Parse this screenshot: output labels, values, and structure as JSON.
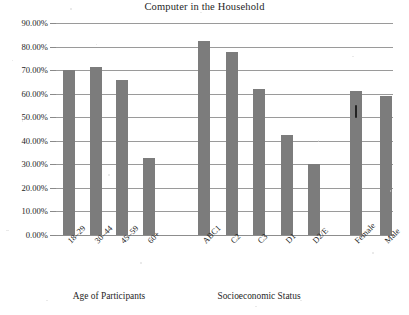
{
  "chart_data": {
    "type": "bar",
    "title": "Computer in the Household",
    "xlabel": "",
    "ylabel": "",
    "ylim": [
      0,
      0.9
    ],
    "grid": true,
    "legend": false,
    "y_tick_labels": [
      "90.00%",
      "80.00%",
      "70.00%",
      "60.00%",
      "50.00%",
      "40.00%",
      "30.00%",
      "20.00%",
      "10.00%",
      "0.00%"
    ],
    "y_tick_values": [
      0.9,
      0.8,
      0.7,
      0.6,
      0.5,
      0.4,
      0.3,
      0.2,
      0.1,
      0.0
    ],
    "categories": [
      "18–29",
      "30–44",
      "45–59",
      "60+",
      "ABC1",
      "C2",
      "C3",
      "D1",
      "D2/E",
      "Female",
      "Male"
    ],
    "values": [
      0.7,
      0.714,
      0.656,
      0.327,
      0.823,
      0.778,
      0.622,
      0.424,
      0.3,
      0.613,
      0.59
    ],
    "value_labels": [
      "70.00%",
      "71.40%",
      "65.60%",
      "32.70%",
      "82.30%",
      "77.80%",
      "62.20%",
      "42.40%",
      "30.00%",
      "61.30%",
      "59.00%"
    ],
    "groups": [
      {
        "label": "Age of Participants",
        "categories": [
          "18–29",
          "30–44",
          "45–59",
          "60+"
        ]
      },
      {
        "label": "Socioeconomic Status",
        "categories": [
          "ABC1",
          "C2",
          "C3",
          "D1",
          "D2/E"
        ]
      },
      {
        "label": "",
        "categories": [
          "Female",
          "Male"
        ]
      }
    ],
    "bar_color": "#7c7c7c",
    "gridline_color": "#9a9a9a",
    "background_color": "#ffffff"
  },
  "annotations": {
    "ink_mark": "ink-smudge-on-female-bar"
  }
}
